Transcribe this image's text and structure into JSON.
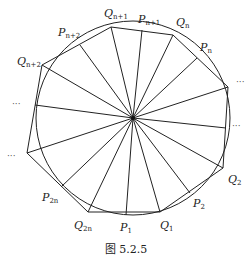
{
  "caption": "图 5.2.5",
  "figure": {
    "center": [
      133,
      118
    ],
    "radius": 97,
    "stroke_color": "#222222",
    "polygon_vertices": [
      {
        "name": "Q_{n+1}",
        "x": 111,
        "y": 27
      },
      {
        "name": "Q_n",
        "x": 173,
        "y": 35
      },
      {
        "name": "Q_right",
        "x": 228,
        "y": 87
      },
      {
        "name": "Q_2",
        "x": 223,
        "y": 168
      },
      {
        "name": "Q_1",
        "x": 160,
        "y": 212
      },
      {
        "name": "Q_{2n}",
        "x": 88,
        "y": 212
      },
      {
        "name": "Q_left",
        "x": 27,
        "y": 153
      },
      {
        "name": "Q_{n+2}",
        "x": 42,
        "y": 65
      }
    ],
    "circle_points": [
      {
        "name": "P_{n+1}",
        "x": 142,
        "y": 30
      },
      {
        "name": "P_n",
        "x": 197,
        "y": 58
      },
      {
        "name": "P_right",
        "x": 226,
        "y": 128
      },
      {
        "name": "P_2",
        "x": 190,
        "y": 193
      },
      {
        "name": "P_1",
        "x": 126,
        "y": 215
      },
      {
        "name": "P_{2n}",
        "x": 61,
        "y": 187
      },
      {
        "name": "P_left",
        "x": 35,
        "y": 105
      },
      {
        "name": "P_{n+2}",
        "x": 80,
        "y": 45
      }
    ]
  },
  "labels": {
    "q_n1": {
      "base": "Q",
      "sub": "n+1"
    },
    "p_n1": {
      "base": "P",
      "sub": "n+1"
    },
    "q_n": {
      "base": "Q",
      "sub": "n"
    },
    "p_n": {
      "base": "P",
      "sub": "n"
    },
    "p_n2": {
      "base": "P",
      "sub": "n+2"
    },
    "q_n2": {
      "base": "Q",
      "sub": "n+2"
    },
    "q_2": {
      "base": "Q",
      "sub": "2"
    },
    "p_2": {
      "base": "P",
      "sub": "2"
    },
    "q_1": {
      "base": "Q",
      "sub": "1"
    },
    "p_1": {
      "base": "P",
      "sub": "1"
    },
    "q_2n": {
      "base": "Q",
      "sub": "2n"
    },
    "p_2n": {
      "base": "P",
      "sub": "2n"
    }
  },
  "ellipses": {
    "right_upper": "···",
    "right_mid": "···",
    "left_upper": "···",
    "left_lower": "···"
  }
}
